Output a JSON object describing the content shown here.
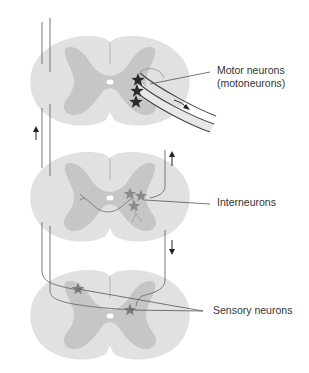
{
  "diagram": {
    "colors": {
      "white_matter": "#e1e1e1",
      "grey_matter": "#c6c6c6",
      "line": "#555555",
      "star_dark": "#2a2a2a",
      "star_gray": "#8a8a8a",
      "canal": "#ffffff"
    },
    "sections": [
      {
        "id": "top",
        "label_line1": "Motor neurons",
        "label_line2": "(motoneurons)"
      },
      {
        "id": "middle",
        "label": "Interneurons"
      },
      {
        "id": "bottom",
        "label": "Sensory neurons"
      }
    ],
    "arrows": [
      {
        "name": "left-up-arrow",
        "direction": "up"
      },
      {
        "name": "right-up-arrow",
        "direction": "up"
      },
      {
        "name": "right-down-arrow",
        "direction": "down"
      },
      {
        "name": "nerve-outflow-arrow",
        "direction": "down-right"
      }
    ]
  }
}
